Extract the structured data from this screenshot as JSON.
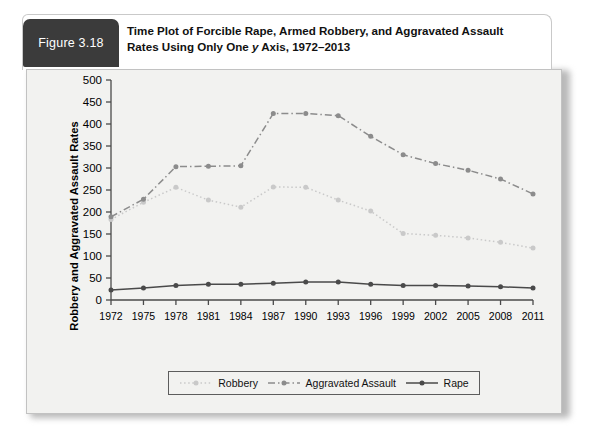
{
  "figure": {
    "tab_label": "Figure 3.18",
    "caption_line1": "Time Plot of Forcible Rape, Armed Robbery, and Aggravated Assault",
    "caption_line2_pre": "Rates Using Only One ",
    "caption_line2_italic": "y",
    "caption_line2_post": " Axis, 1972–2013"
  },
  "chart_data": {
    "type": "line",
    "title": "Time Plot of Forcible Rape, Armed Robbery, and Aggravated Assault Rates Using Only One y Axis, 1972–2013",
    "xlabel": "",
    "ylabel": "Robbery and Aggravated Assault Rates",
    "x": [
      1972,
      1975,
      1978,
      1981,
      1984,
      1987,
      1990,
      1993,
      1996,
      1999,
      2002,
      2005,
      2008,
      2011
    ],
    "xtick_labels": [
      "1972",
      "1975",
      "1978",
      "1981",
      "1984",
      "1987",
      "1990",
      "1993",
      "1996",
      "1999",
      "2002",
      "2005",
      "2008",
      "2011"
    ],
    "ytick_labels": [
      "0",
      "50",
      "100",
      "150",
      "200",
      "250",
      "300",
      "350",
      "400",
      "450",
      "500"
    ],
    "yticks": [
      0,
      50,
      100,
      150,
      200,
      250,
      300,
      350,
      400,
      450,
      500
    ],
    "ylim": [
      0,
      500
    ],
    "xlim": [
      1972,
      2011
    ],
    "grid": false,
    "legend_position": "bottom",
    "series": [
      {
        "name": "Robbery",
        "color": "#c9c9c9",
        "style": "dotted",
        "values": [
          183,
          222,
          256,
          227,
          211,
          257,
          256,
          227,
          202,
          151,
          147,
          141,
          131,
          118
        ]
      },
      {
        "name": "Aggravated Assault",
        "color": "#8c8c8c",
        "style": "dash-dot",
        "values": [
          189,
          229,
          303,
          304,
          305,
          424,
          424,
          419,
          372,
          330,
          310,
          295,
          275,
          241
        ]
      },
      {
        "name": "Rape",
        "color": "#4a4a4a",
        "style": "solid",
        "values": [
          23,
          27,
          33,
          36,
          36,
          38,
          41,
          41,
          36,
          33,
          33,
          32,
          30,
          27
        ]
      }
    ]
  },
  "legend": {
    "items": [
      {
        "label": "Robbery"
      },
      {
        "label": "Aggravated Assault"
      },
      {
        "label": "Rape"
      }
    ]
  }
}
